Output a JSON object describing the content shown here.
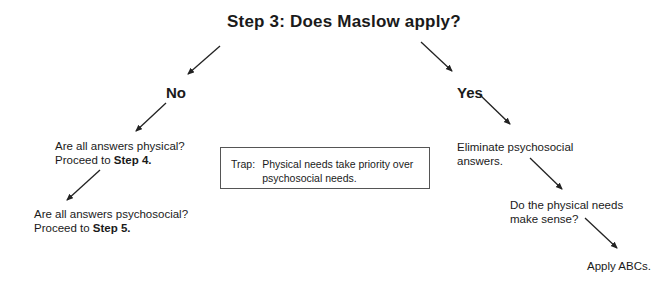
{
  "title": "Step 3:  Does Maslow apply?",
  "branches": {
    "no": "No",
    "yes": "Yes"
  },
  "no_path": {
    "q1_line1": "Are all answers physical?",
    "q1_line2_prefix": "Proceed to ",
    "q1_line2_bold": "Step 4.",
    "q2_line1": "Are all answers psychosocial?",
    "q2_line2_prefix": "Proceed to ",
    "q2_line2_bold": "Step 5."
  },
  "trap": {
    "label": "Trap:",
    "text_line1": "Physical needs take priority over",
    "text_line2": "psychosocial needs."
  },
  "yes_path": {
    "s1_line1": "Eliminate psychosocial",
    "s1_line2": "answers.",
    "s2_line1": "Do the physical needs",
    "s2_line2": "make sense?",
    "s3": "Apply ABCs."
  },
  "colors": {
    "text": "#1a1a1a",
    "arrow": "#222222",
    "box_border": "#555555"
  }
}
